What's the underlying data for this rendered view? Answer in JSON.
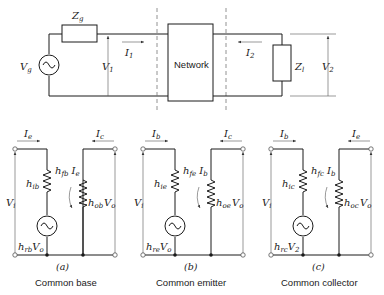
{
  "top_circuit": {
    "source_label": "V",
    "source_sub": "g",
    "generator_impedance": "Z",
    "generator_impedance_sub": "g",
    "input_voltage": "V",
    "input_voltage_sub": "1",
    "input_current": "I",
    "input_current_sub": "1",
    "network_label": "Network",
    "output_current": "I",
    "output_current_sub": "2",
    "load_impedance": "Z",
    "load_impedance_sub": "l",
    "output_voltage": "V",
    "output_voltage_sub": "2"
  },
  "subcircuits": [
    {
      "caption_letter": "(a)",
      "caption": "Common base",
      "in_current": "I",
      "in_current_sub": "e",
      "out_current": "I",
      "out_current_sub": "c",
      "in_voltage": "V",
      "in_voltage_sub": "i",
      "out_voltage": "V",
      "out_voltage_sub": "o",
      "input_resistance": "h",
      "input_resistance_sub": "ib",
      "forward_gain": "h",
      "forward_gain_sub": "fb",
      "forward_gain_ctrl": "I",
      "forward_gain_ctrl_sub": "e",
      "output_conductance": "h",
      "output_conductance_sub": "ob",
      "reverse_source": "h",
      "reverse_source_sub": "rb",
      "reverse_source_ctrl": "V",
      "reverse_source_ctrl_sub": "o"
    },
    {
      "caption_letter": "(b)",
      "caption": "Common emitter",
      "in_current": "I",
      "in_current_sub": "b",
      "out_current": "I",
      "out_current_sub": "c",
      "in_voltage": "V",
      "in_voltage_sub": "i",
      "out_voltage": "V",
      "out_voltage_sub": "o",
      "input_resistance": "h",
      "input_resistance_sub": "ie",
      "forward_gain": "h",
      "forward_gain_sub": "fe",
      "forward_gain_ctrl": "I",
      "forward_gain_ctrl_sub": "b",
      "output_conductance": "h",
      "output_conductance_sub": "oe",
      "reverse_source": "h",
      "reverse_source_sub": "re",
      "reverse_source_ctrl": "V",
      "reverse_source_ctrl_sub": "o"
    },
    {
      "caption_letter": "(c)",
      "caption": "Common collector",
      "in_current": "I",
      "in_current_sub": "b",
      "out_current": "I",
      "out_current_sub": "e",
      "in_voltage": "V",
      "in_voltage_sub": "i",
      "out_voltage": "V",
      "out_voltage_sub": "o",
      "input_resistance": "h",
      "input_resistance_sub": "ic",
      "forward_gain": "h",
      "forward_gain_sub": "fc",
      "forward_gain_ctrl": "I",
      "forward_gain_ctrl_sub": "b",
      "output_conductance": "h",
      "output_conductance_sub": "oc",
      "reverse_source": "h",
      "reverse_source_sub": "rc",
      "reverse_source_ctrl": "V",
      "reverse_source_ctrl_sub": "2"
    }
  ]
}
